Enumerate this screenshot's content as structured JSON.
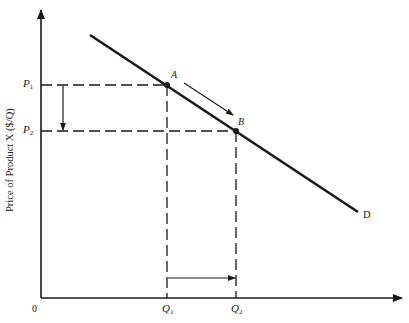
{
  "diagram": {
    "type": "demand-curve",
    "y_axis_label": "Price of Product X ($/Q)",
    "origin_label": "0",
    "curve_label": "D",
    "points": [
      {
        "name": "A",
        "price_label": "P",
        "price_sub": "1",
        "quantity_label": "Q",
        "quantity_sub": "1"
      },
      {
        "name": "B",
        "price_label": "P",
        "price_sub": "2",
        "quantity_label": "Q",
        "quantity_sub": "2"
      }
    ],
    "arrows": [
      {
        "from": "P1",
        "to": "P2",
        "meaning": "price decrease"
      },
      {
        "from": "Q1",
        "to": "Q2",
        "meaning": "quantity increase"
      },
      {
        "from": "A",
        "to": "B",
        "meaning": "movement along demand curve"
      }
    ],
    "colors": {
      "line": "#1a1a1a",
      "background": "#ffffff"
    }
  }
}
